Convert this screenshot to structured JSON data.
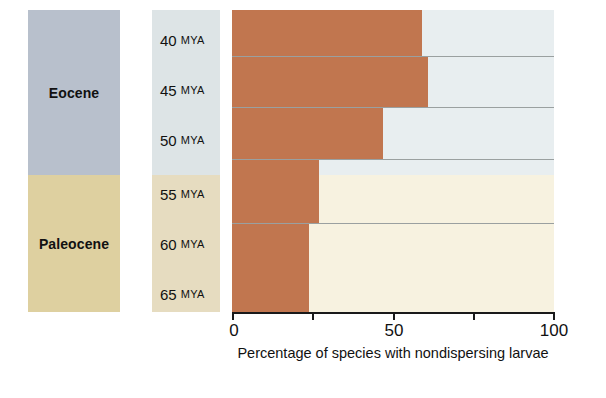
{
  "chart_data": {
    "type": "bar",
    "orientation": "horizontal",
    "title": "",
    "xlabel": "Percentage of species with nondispersing larvae",
    "ylabel": "",
    "xlim": [
      0,
      100
    ],
    "xticks": [
      0,
      25,
      50,
      75,
      100
    ],
    "xtick_labels": [
      "0",
      "",
      "50",
      "",
      "100"
    ],
    "grid": false,
    "categories": [
      "40 MYA",
      "45 MYA",
      "50 MYA",
      "55 MYA",
      "60 MYA",
      "65 MYA"
    ],
    "rows": [
      {
        "age_label": "40 MYA",
        "age_number": "40",
        "age_unit": "MYA",
        "value": 59,
        "epoch": "Eocene"
      },
      {
        "age_label": "45 MYA",
        "age_number": "45",
        "age_unit": "MYA",
        "value": 61,
        "epoch": "Eocene"
      },
      {
        "age_label": "50 MYA",
        "age_number": "50",
        "age_unit": "MYA",
        "value": 47,
        "epoch": "Eocene"
      },
      {
        "age_label": "55 MYA",
        "age_number": "55",
        "age_unit": "MYA",
        "value": 27,
        "epoch": "Eocene/Paleocene"
      },
      {
        "age_label": "60 MYA",
        "age_number": "60",
        "age_unit": "MYA",
        "value": 27,
        "epoch": "Paleocene"
      },
      {
        "age_label": "65 MYA",
        "age_number": "65",
        "age_unit": "MYA",
        "value": 24,
        "epoch": "Paleocene"
      }
    ],
    "values": [
      59,
      61,
      47,
      27,
      27,
      24
    ],
    "epochs": [
      {
        "name": "Eocene",
        "color": "#b8c0cc"
      },
      {
        "name": "Paleocene",
        "color": "#ded0a0"
      }
    ],
    "colors": {
      "bar": "#c1764f",
      "eocene_band": "#b8c0cc",
      "paleocene_band": "#ded0a0",
      "eocene_mya_band": "#dde4e6",
      "paleocene_mya_band": "#e6dcc0",
      "eocene_plot_bg": "#e8eef0",
      "paleocene_plot_bg": "#f7f2e0",
      "axis": "#1a1a1a",
      "row_separator": "#9aa0a0",
      "page_bg": "#ffffff"
    }
  }
}
